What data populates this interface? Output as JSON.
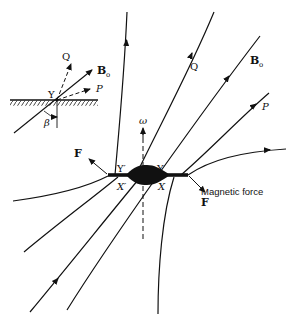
{
  "figure": {
    "inset": {
      "labels": {
        "q": "Q",
        "b": "B",
        "b_sub": "o",
        "p": "P",
        "y": "Y",
        "beta": "β"
      }
    },
    "main": {
      "labels": {
        "q": "Q",
        "b": "B",
        "b_sub": "o",
        "p": "P",
        "omega": "ω",
        "y_prime": "Y′",
        "y": "Y",
        "x_prime": "X′",
        "x": "X",
        "f_left": "F",
        "magnetic_force": "Magnetic force",
        "f_right": "F"
      }
    },
    "colors": {
      "ink": "#111111",
      "background": "#ffffff"
    }
  }
}
